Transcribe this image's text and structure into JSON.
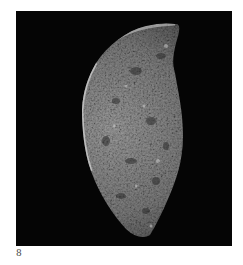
{
  "figure": {
    "label": "8",
    "colors": {
      "page_background": "#ffffff",
      "plate_background": "#050505",
      "stone_mid": "#8a8a8a",
      "stone_light": "#d0d0d0",
      "stone_dark": "#3a3a3a",
      "label_color": "#444444"
    }
  }
}
